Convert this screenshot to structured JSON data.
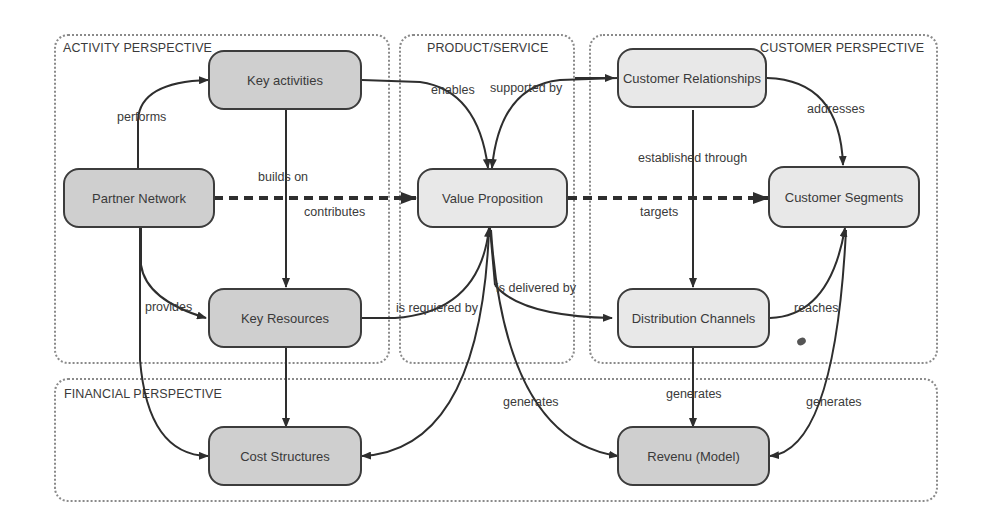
{
  "containers": {
    "activity": "ACTIVITY PERSPECTIVE",
    "product": "PRODUCT/SERVICE",
    "customer": "CUSTOMER PERSPECTIVE",
    "financial": "FINANCIAL PERSPECTIVE"
  },
  "nodes": {
    "key_activities": "Key activities",
    "partner_network": "Partner Network",
    "key_resources": "Key Resources",
    "cost_structures": "Cost Structures",
    "value_proposition": "Value Proposition",
    "customer_relationships": "Customer Relationships",
    "customer_segments": "Customer Segments",
    "distribution_channels": "Distribution Channels",
    "revenue_model": "Revenu (Model)"
  },
  "edges": {
    "performs": "performs",
    "builds_on": "builds on",
    "contributes": "contributes",
    "provides": "provides",
    "enables": "enables",
    "supported_by": "supported by",
    "addresses": "addresses",
    "established_through": "established through",
    "targets": "targets",
    "is_requiered_by": "is requiered by",
    "is_delivered_by": "is delivered by",
    "reaches": "reaches",
    "generates_left": "generates",
    "generates_center": "generates",
    "generates_right": "generates"
  },
  "colors": {
    "node_dark": "#cfcfcf",
    "node_light": "#e8e8e8",
    "stroke": "#3c3c3c",
    "container_border": "#8a8a8a"
  }
}
